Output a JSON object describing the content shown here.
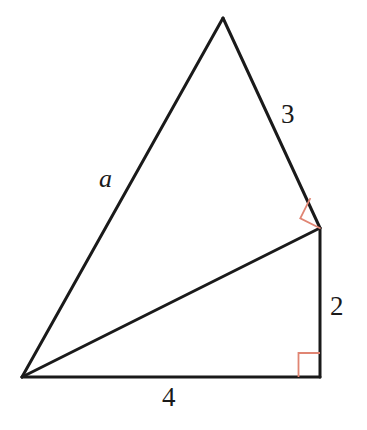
{
  "figure": {
    "kind": "geometry-diagram",
    "background_color": "#ffffff",
    "stroke_color": "#1a1a1a",
    "stroke_width": 3,
    "right_angle_color": "#e08573",
    "right_angle_width": 1.6,
    "vertices": {
      "apex": {
        "name": "apex",
        "x": 223,
        "y": 18
      },
      "right": {
        "name": "right-middle",
        "x": 320,
        "y": 228
      },
      "bottom_left": {
        "name": "bottom-left",
        "x": 22,
        "y": 377
      },
      "bottom_right": {
        "name": "bottom-right",
        "x": 320,
        "y": 377
      }
    },
    "segments": [
      {
        "name": "segment-a",
        "from": "apex",
        "to": "bottom_left",
        "label": "a"
      },
      {
        "name": "segment-3",
        "from": "apex",
        "to": "right",
        "label": "3"
      },
      {
        "name": "segment-hypotenuse",
        "from": "right",
        "to": "bottom_left",
        "label": ""
      },
      {
        "name": "segment-2",
        "from": "right",
        "to": "bottom_right",
        "label": "2"
      },
      {
        "name": "segment-4",
        "from": "bottom_left",
        "to": "bottom_right",
        "label": "4"
      }
    ],
    "right_angles": [
      {
        "name": "right-angle-upper",
        "at": "right",
        "size": 22,
        "rotated": true
      },
      {
        "name": "right-angle-lower",
        "at": "bottom_right",
        "size": 22,
        "rotated": false
      }
    ],
    "labels": {
      "side_3": "3",
      "side_a": "a",
      "side_2": "2",
      "side_4": "4"
    }
  }
}
